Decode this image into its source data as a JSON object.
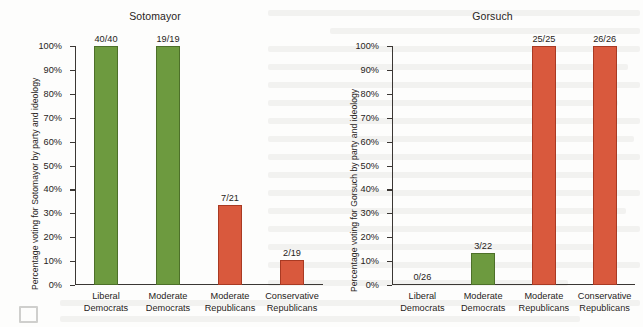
{
  "figure": {
    "background_color": "#fdfdfc",
    "green_color": "#6d9a3f",
    "red_color": "#d9593d",
    "axis_color": "#3b3734",
    "text_color": "#272321"
  },
  "y_ticks": [
    "100%",
    "90%",
    "80%",
    "70%",
    "60%",
    "50%",
    "40%",
    "30%",
    "20%",
    "10%",
    "0%"
  ],
  "categories": [
    {
      "line1": "Liberal",
      "line2": "Democrats"
    },
    {
      "line1": "Moderate",
      "line2": "Democrats"
    },
    {
      "line1": "Moderate",
      "line2": "Republicans"
    },
    {
      "line1": "Conservative",
      "line2": "Republicans"
    }
  ],
  "chart_data": [
    {
      "type": "bar",
      "title": "Sotomayor",
      "xlabel": "",
      "ylabel": "Percentage voting for Sotomayor by party and ideology",
      "ylim": [
        0,
        100
      ],
      "ytick_values": [
        0,
        10,
        20,
        30,
        40,
        50,
        60,
        70,
        80,
        90,
        100
      ],
      "ytick_labels": [
        "0%",
        "10%",
        "20%",
        "30%",
        "40%",
        "50%",
        "60%",
        "70%",
        "80%",
        "90%",
        "100%"
      ],
      "grid": false,
      "legend": "none",
      "categories": [
        "Liberal Democrats",
        "Moderate Democrats",
        "Moderate Republicans",
        "Conservative Republicans"
      ],
      "values": [
        100.0,
        100.0,
        33.3,
        10.5
      ],
      "data_labels": [
        "40/40",
        "19/19",
        "7/21",
        "2/19"
      ],
      "bar_colors": [
        "#6d9a3f",
        "#6d9a3f",
        "#d9593d",
        "#d9593d"
      ]
    },
    {
      "type": "bar",
      "title": "Gorsuch",
      "xlabel": "",
      "ylabel": "Percentage voting for Gorsuch by party and ideology",
      "ylim": [
        0,
        100
      ],
      "ytick_values": [
        0,
        10,
        20,
        30,
        40,
        50,
        60,
        70,
        80,
        90,
        100
      ],
      "ytick_labels": [
        "0%",
        "10%",
        "20%",
        "30%",
        "40%",
        "50%",
        "60%",
        "70%",
        "80%",
        "90%",
        "100%"
      ],
      "grid": false,
      "legend": "none",
      "categories": [
        "Liberal Democrats",
        "Moderate Democrats",
        "Moderate Republicans",
        "Conservative Republicans"
      ],
      "values": [
        0.0,
        13.6,
        100.0,
        100.0
      ],
      "data_labels": [
        "0/26",
        "3/22",
        "25/25",
        "26/26"
      ],
      "bar_colors": [
        "#6d9a3f",
        "#6d9a3f",
        "#d9593d",
        "#d9593d"
      ]
    }
  ]
}
